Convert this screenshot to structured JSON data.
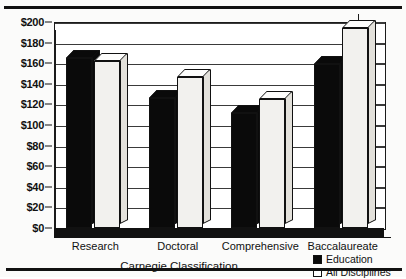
{
  "chart_data": {
    "type": "bar",
    "title": "",
    "xlabel": "Carnegie Classification",
    "ylabel": "",
    "categories": [
      "Research",
      "Doctoral",
      "Comprehensive",
      "Baccalaureate"
    ],
    "series": [
      {
        "name": "Education",
        "values": [
          165,
          126,
          112,
          159
        ],
        "color": "#0a0a0a"
      },
      {
        "name": "All Disciplines",
        "values": [
          162,
          147,
          125,
          194
        ],
        "color": "#f2f1ee"
      }
    ],
    "ylim": [
      0,
      200
    ],
    "ytick_step": 20,
    "ytick_labels": [
      "$200",
      "$180",
      "$160",
      "$140",
      "$120",
      "$100",
      "$80",
      "$60",
      "$40",
      "$20",
      "$0"
    ],
    "ytick_values": [
      200,
      180,
      160,
      140,
      120,
      100,
      80,
      60,
      40,
      20,
      0
    ],
    "grid": true,
    "legend_position": "bottom-right",
    "style": "3d-bar"
  },
  "legend": {
    "entries": [
      {
        "label": "Education",
        "swatch": "filled"
      },
      {
        "label": "All Disciplines",
        "swatch": "hollow"
      }
    ]
  }
}
